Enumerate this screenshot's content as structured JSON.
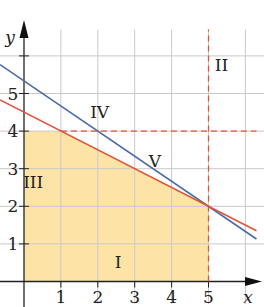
{
  "chart_data": {
    "type": "line",
    "title": "",
    "xlabel": "x",
    "ylabel": "y",
    "xlim": [
      -0.6,
      6.4
    ],
    "ylim": [
      -0.6,
      6.7
    ],
    "x_ticks": [
      "1",
      "2",
      "3",
      "4",
      "5"
    ],
    "y_ticks": [
      "1",
      "2",
      "3",
      "4",
      "5"
    ],
    "grid": true,
    "series": [
      {
        "name": "blue line",
        "color": "#4a6aa8",
        "equation": "y = 16/3 - (2/3)x",
        "points": [
          [
            -0.65,
            5.77
          ],
          [
            6.3,
            1.13
          ]
        ]
      },
      {
        "name": "red line",
        "color": "#e0553a",
        "equation": "y = 4.5 - 0.5x",
        "points": [
          [
            -0.65,
            4.83
          ],
          [
            6.3,
            1.35
          ]
        ]
      },
      {
        "name": "dashed horizontal",
        "color": "#e0553a",
        "style": "dashed",
        "equation": "y = 4",
        "points": [
          [
            1,
            4
          ],
          [
            6.3,
            4
          ]
        ]
      },
      {
        "name": "dashed vertical",
        "color": "#e0553a",
        "style": "dashed",
        "equation": "x = 5",
        "points": [
          [
            5,
            0
          ],
          [
            5,
            6.7
          ]
        ]
      }
    ],
    "shaded_region": {
      "color": "#fde4a6",
      "vertices": [
        [
          0,
          0
        ],
        [
          0,
          4
        ],
        [
          1,
          4
        ],
        [
          5,
          2
        ],
        [
          5,
          0
        ]
      ]
    },
    "region_labels": [
      {
        "text": "I",
        "x": 2.55,
        "y": 0.35
      },
      {
        "text": "II",
        "x": 5.35,
        "y": 5.6
      },
      {
        "text": "III",
        "x": 0.25,
        "y": 2.5
      },
      {
        "text": "IV",
        "x": 2.05,
        "y": 4.35
      },
      {
        "text": "V",
        "x": 3.55,
        "y": 3.05
      }
    ]
  }
}
